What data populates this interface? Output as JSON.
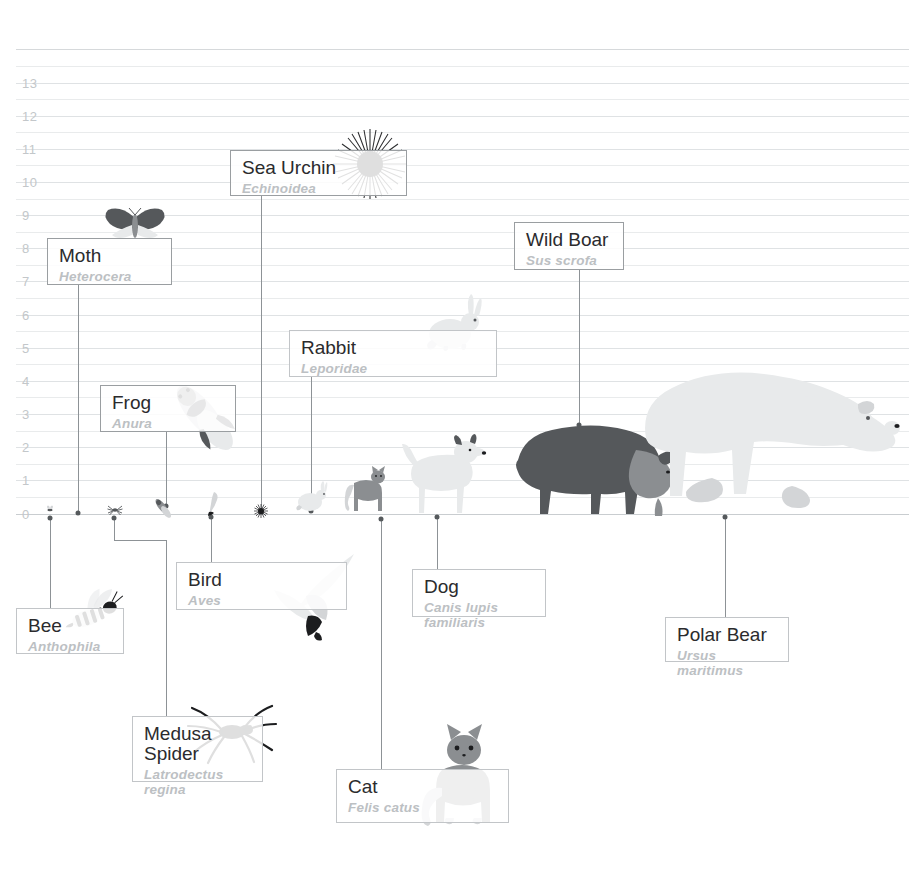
{
  "chart_data": {
    "type": "bar",
    "xlabel": "",
    "ylabel": "",
    "ylim": [
      0,
      14
    ],
    "grid": true,
    "legend": "none",
    "axis": {
      "tick_labels": [
        "0",
        "1",
        "2",
        "3",
        "4",
        "5",
        "6",
        "7",
        "8",
        "9",
        "10",
        "11",
        "12",
        "13"
      ],
      "tick_values": [
        0,
        1,
        2,
        3,
        4,
        5,
        6,
        7,
        8,
        9,
        10,
        11,
        12,
        13
      ],
      "minor_gridlines": true,
      "minor_step": 0.5
    },
    "categories": [
      "Bee",
      "Medusa Spider",
      "Frog",
      "Bird",
      "Sea Urchin",
      "Rabbit",
      "Cat",
      "Dog",
      "Wild Boar",
      "Polar Bear"
    ],
    "values": [
      0.05,
      0.1,
      0.25,
      0.3,
      0.2,
      0.8,
      1.3,
      2.2,
      3.0,
      4.5
    ]
  },
  "labels": [
    {
      "id": "sea-urchin",
      "common": "Sea Urchin",
      "scientific": "Echinoidea"
    },
    {
      "id": "moth",
      "common": "Moth",
      "scientific": "Heterocera"
    },
    {
      "id": "wild-boar",
      "common": "Wild Boar",
      "scientific": "Sus scrofa"
    },
    {
      "id": "rabbit",
      "common": "Rabbit",
      "scientific": "Leporidae"
    },
    {
      "id": "frog",
      "common": "Frog",
      "scientific": "Anura"
    },
    {
      "id": "bird",
      "common": "Bird",
      "scientific": "Aves"
    },
    {
      "id": "dog",
      "common": "Dog",
      "scientific": "Canis lupis familiaris"
    },
    {
      "id": "polar-bear",
      "common": "Polar Bear",
      "scientific": "Ursus maritimus"
    },
    {
      "id": "bee",
      "common": "Bee",
      "scientific": "Anthophila"
    },
    {
      "id": "medusa-spider",
      "common": "Medusa\nSpider",
      "scientific": "Latrodectus regina"
    },
    {
      "id": "cat",
      "common": "Cat",
      "scientific": "Felis catus"
    }
  ],
  "colors": {
    "background": "#ffffff",
    "gridline": "#e9ebec",
    "gridline_major": "#dfe2e4",
    "baseline": "#c9cdd0",
    "tick_text": "#c3c7ca",
    "callout_border": "#9a9ea1",
    "callout_border_light": "#c2c5c8",
    "common_text": "#2b2b2d",
    "scientific_text": "#bcc0c3",
    "leader_line": "#8d9296"
  }
}
